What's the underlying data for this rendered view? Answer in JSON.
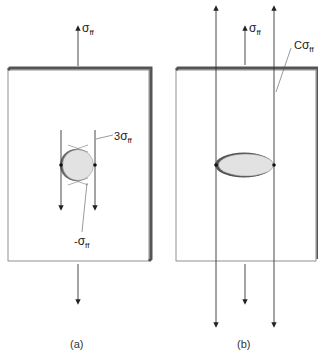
{
  "figure": {
    "panel_a": {
      "caption": "(a)",
      "top_load_label": {
        "symbol": "σ",
        "subscript": "ff"
      },
      "edge_stress_label": {
        "prefix": "3",
        "symbol": "σ",
        "subscript": "ff"
      },
      "pole_stress_label": {
        "prefix": "-",
        "symbol": "σ",
        "subscript": "ff"
      },
      "hole_shape": "circle"
    },
    "panel_b": {
      "caption": "(b)",
      "top_load_label": {
        "symbol": "σ",
        "subscript": "ff"
      },
      "edge_stress_label": {
        "prefix": "C",
        "symbol": "σ",
        "subscript": "ff"
      },
      "hole_shape": "ellipse"
    },
    "colors": {
      "plate_fill": "#ffffff",
      "plate_edge": "#555555",
      "hole_fill": "#e2e2e2",
      "line": "#333333"
    }
  }
}
